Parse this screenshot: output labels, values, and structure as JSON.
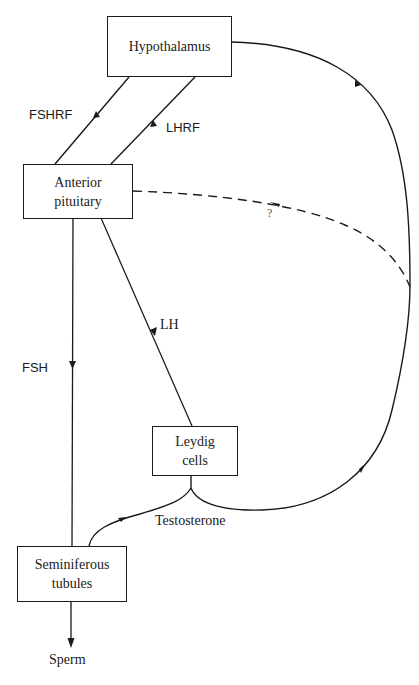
{
  "diagram": {
    "type": "hormonal-regulation-flowchart",
    "nodes": {
      "hypothalamus": {
        "line1": "Hypothalamus",
        "line2": ""
      },
      "anterior_pituitary": {
        "line1": "Anterior",
        "line2": "pituitary"
      },
      "leydig_cells": {
        "line1": "Leydig",
        "line2": "cells"
      },
      "seminiferous_tubules": {
        "line1": "Seminiferous",
        "line2": "tubules"
      }
    },
    "edge_labels": {
      "fshrf": "FSHRF",
      "lhrf": "LHRF",
      "lh": "LH",
      "fsh": "FSH",
      "testosterone": "Testosterone",
      "unknown_feedback": "?",
      "sperm": "Sperm"
    },
    "edges": [
      {
        "from": "Hypothalamus",
        "to": "Anterior pituitary",
        "label": "FSHRF",
        "style": "solid"
      },
      {
        "from": "Hypothalamus",
        "to": "Anterior pituitary",
        "label": "LHRF",
        "style": "solid"
      },
      {
        "from": "Anterior pituitary",
        "to": "Seminiferous tubules",
        "label": "FSH",
        "style": "solid"
      },
      {
        "from": "Anterior pituitary",
        "to": "Leydig cells",
        "label": "LH",
        "style": "solid"
      },
      {
        "from": "Leydig cells",
        "to": "Seminiferous tubules",
        "label": "Testosterone",
        "style": "solid"
      },
      {
        "from": "Leydig cells",
        "to": "Hypothalamus",
        "label": "Testosterone feedback",
        "style": "solid"
      },
      {
        "from": "Leydig cells",
        "to": "Anterior pituitary",
        "label": "?",
        "style": "dashed"
      },
      {
        "from": "Seminiferous tubules",
        "to": "Sperm",
        "label": "Sperm",
        "style": "solid"
      }
    ],
    "colors": {
      "line": "#1a1a1a",
      "background": "#ffffff"
    }
  }
}
